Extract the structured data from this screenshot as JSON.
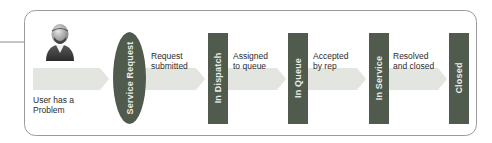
{
  "diagram": {
    "type": "process-flow",
    "colors": {
      "frame_border": "#9a9a9a",
      "arrow_fill": "#e3e5e1",
      "stage_fill": "#505b4d",
      "stage_text": "#e9ece6",
      "label_text": "#2b2b2b"
    },
    "actor": {
      "icon": "user-icon",
      "label": "User has a\nProblem"
    },
    "stages": [
      {
        "id": "service-request",
        "label": "Service Request",
        "shape": "ellipse"
      },
      {
        "id": "in-dispatch",
        "label": "In Dispatch",
        "shape": "rectangle"
      },
      {
        "id": "in-queue",
        "label": "In Queue",
        "shape": "rectangle"
      },
      {
        "id": "in-service",
        "label": "In Service",
        "shape": "rectangle"
      },
      {
        "id": "closed",
        "label": "Closed",
        "shape": "rectangle"
      }
    ],
    "transitions": [
      {
        "from": "actor",
        "to": "service-request",
        "label": ""
      },
      {
        "from": "service-request",
        "to": "in-dispatch",
        "label": "Request\nsubmitted"
      },
      {
        "from": "in-dispatch",
        "to": "in-queue",
        "label": "Assigned\nto queue"
      },
      {
        "from": "in-queue",
        "to": "in-service",
        "label": "Accepted\nby rep"
      },
      {
        "from": "in-service",
        "to": "closed",
        "label": "Resolved\nand closed"
      }
    ]
  }
}
